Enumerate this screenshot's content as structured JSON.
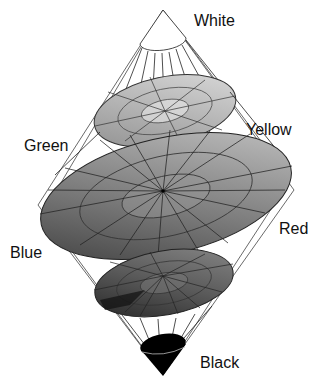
{
  "diagram": {
    "type": "double-cone color space",
    "labels": {
      "white": "White",
      "yellow": "Yellow",
      "green": "Green",
      "blue": "Blue",
      "red": "Red",
      "black": "Black"
    },
    "levels": [
      {
        "name": "white-cap",
        "shade": "#ffffff"
      },
      {
        "name": "upper-slice",
        "shade": "#bdbdbd"
      },
      {
        "name": "middle-slice",
        "shade": "#8a8a8a"
      },
      {
        "name": "lower-slice",
        "shade": "#5e5e5e"
      },
      {
        "name": "black-cap",
        "shade": "#000000"
      }
    ]
  }
}
